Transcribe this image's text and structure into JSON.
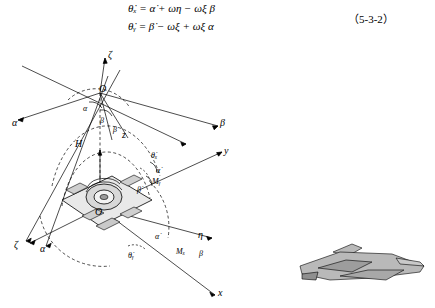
{
  "equations": {
    "line1": "θ̇ₓ = α̇ + ωη − ωξ β",
    "line2": "θ̇ᵧ = β̇ − ωξ + ωξ α",
    "number": "（5-3-2）"
  },
  "axis_labels": {
    "zeta_top": "ζ",
    "zeta_left": "ζ",
    "alpha_upper_left": "α",
    "alpha_lower_left": "α",
    "beta_right": "β",
    "beta_mid": "β",
    "beta_lower": "β",
    "eta_right": "η",
    "x_axis": "x",
    "y_axis": "y",
    "z_axis": "z",
    "origin_upper": "O",
    "origin_lower": "O"
  },
  "annotations": {
    "alpha_small": "α",
    "beta_small": "β",
    "H": "H",
    "theta_x_dot": "θ̇ₓ",
    "theta_y_dot": "θ̇ᵧ",
    "alpha_dot": "α̇",
    "beta_dot": "β̇",
    "M_y": "Mᵧ",
    "M_x": "Mₓ"
  },
  "figure": {
    "caption": "",
    "aircraft": "fighter-jet-silhouette"
  }
}
